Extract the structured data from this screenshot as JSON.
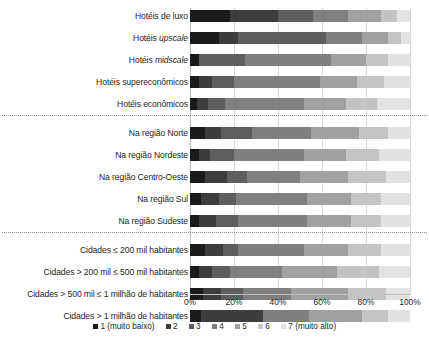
{
  "chart_data": {
    "type": "bar",
    "subtype": "stacked-horizontal-100pct",
    "title": "",
    "xlabel": "",
    "ylabel": "",
    "xlim": [
      0,
      100
    ],
    "xticks": [
      0,
      20,
      40,
      60,
      80,
      100
    ],
    "xtick_labels": [
      "0%",
      "20%",
      "40%",
      "60%",
      "80%",
      "100%"
    ],
    "grid": true,
    "legend_position": "bottom",
    "colors": {
      "1": "#1a1a1a",
      "2": "#3d3d3d",
      "3": "#5e5e5e",
      "4": "#7f7f7f",
      "5": "#a0a0a0",
      "6": "#c4c4c4",
      "7": "#e2e2e2"
    },
    "series": [
      {
        "name": "1 (muito baixo)",
        "key": "1"
      },
      {
        "name": "2",
        "key": "2"
      },
      {
        "name": "3",
        "key": "3"
      },
      {
        "name": "4",
        "key": "4"
      },
      {
        "name": "5",
        "key": "5"
      },
      {
        "name": "6",
        "key": "6"
      },
      {
        "name": "7 (muito alto)",
        "key": "7"
      }
    ],
    "groups": [
      {
        "name": "tipo-hotel",
        "categories": [
          {
            "label": "Hotéis de luxo",
            "values": [
              18,
              22,
              16,
              16,
              15,
              7,
              6
            ]
          },
          {
            "label": "Hotéis <em>upscale</em>",
            "values": [
              13,
              9,
              40,
              16,
              12,
              6,
              4
            ]
          },
          {
            "label": "Hotéis <em>midscale</em>",
            "values": [
              4,
              0,
              21,
              39,
              16,
              10,
              10
            ]
          },
          {
            "label": "Hotéis supereconômicos",
            "values": [
              4,
              6,
              10,
              39,
              17,
              12,
              12
            ]
          },
          {
            "label": "Hotéis econômicos",
            "values": [
              3,
              5,
              8,
              36,
              19,
              14,
              15
            ]
          }
        ]
      },
      {
        "name": "regiao",
        "categories": [
          {
            "label": "Na região Norte",
            "values": [
              7,
              7,
              14,
              27,
              22,
              13,
              10
            ]
          },
          {
            "label": "Na região Nordeste",
            "values": [
              4,
              5,
              11,
              32,
              19,
              15,
              14
            ]
          },
          {
            "label": "Na região Centro-Oeste",
            "values": [
              7,
              10,
              9,
              24,
              22,
              17,
              11
            ]
          },
          {
            "label": "Na região Sul",
            "values": [
              5,
              8,
              8,
              32,
              20,
              14,
              13
            ]
          },
          {
            "label": "Na região Sudeste",
            "values": [
              4,
              8,
              10,
              31,
              20,
              14,
              13
            ]
          }
        ]
      },
      {
        "name": "porte-cidade",
        "categories": [
          {
            "label": "Cidades ≤ 200 mil habitantes",
            "values": [
              7,
              8,
              7,
              30,
              20,
              15,
              13
            ]
          },
          {
            "label": "Cidades > 200 mil ≤ 500 mil habitantes",
            "values": [
              4,
              6,
              8,
              24,
              25,
              19,
              14
            ]
          },
          {
            "label": "Cidades > 500 mil ≤ 1 milhão de habitantes",
            "values": [
              6,
              8,
              10,
              22,
              26,
              17,
              11
            ]
          },
          {
            "label": "Cidades > 1 milhão de habitantes",
            "values": [
              5,
              28,
              0,
              21,
              24,
              12,
              10
            ]
          }
        ]
      }
    ]
  }
}
